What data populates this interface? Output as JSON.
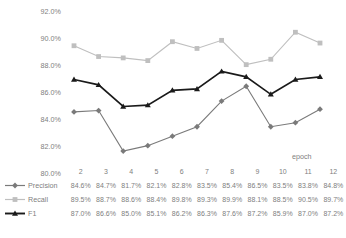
{
  "chart_data": {
    "type": "line",
    "title": "",
    "xlabel": "epoch",
    "ylabel": "",
    "x": [
      2,
      3,
      4,
      5,
      6,
      7,
      8,
      9,
      10,
      11,
      12
    ],
    "categories": [
      "2",
      "3",
      "4",
      "5",
      "6",
      "7",
      "8",
      "9",
      "10",
      "11",
      "12"
    ],
    "ylim": [
      80.0,
      92.0
    ],
    "ytick_step": 2.0,
    "yticks": [
      "92.0%",
      "90.0%",
      "88.0%",
      "86.0%",
      "84.0%",
      "82.0%",
      "80.0%"
    ],
    "ytick_values": [
      92.0,
      90.0,
      88.0,
      86.0,
      84.0,
      82.0,
      80.0
    ],
    "grid": false,
    "legend_position": "bottom-table",
    "series": [
      {
        "name": "Precision",
        "marker": "diamond",
        "color": "#7a7a7a",
        "values": [
          84.6,
          84.7,
          81.7,
          82.1,
          82.8,
          83.5,
          85.4,
          86.5,
          83.5,
          83.8,
          84.8
        ],
        "labels": [
          "84.6%",
          "84.7%",
          "81.7%",
          "82.1%",
          "82.8%",
          "83.5%",
          "85.4%",
          "86.5%",
          "83.5%",
          "83.8%",
          "84.8%"
        ]
      },
      {
        "name": "Recall",
        "marker": "square",
        "color": "#bfbfbf",
        "values": [
          89.5,
          88.7,
          88.6,
          88.4,
          89.8,
          89.3,
          89.9,
          88.1,
          88.5,
          90.5,
          89.7
        ],
        "labels": [
          "89.5%",
          "88.7%",
          "88.6%",
          "88.4%",
          "89.8%",
          "89.3%",
          "89.9%",
          "88.1%",
          "88.5%",
          "90.5%",
          "89.7%"
        ]
      },
      {
        "name": "F1",
        "marker": "triangle",
        "color": "#1a1a1a",
        "values": [
          87.0,
          86.6,
          85.0,
          85.1,
          86.2,
          86.3,
          87.6,
          87.2,
          85.9,
          87.0,
          87.2
        ],
        "labels": [
          "87.0%",
          "86.6%",
          "85.0%",
          "85.1%",
          "86.2%",
          "86.3%",
          "87.6%",
          "87.2%",
          "85.9%",
          "87.0%",
          "87.2%"
        ]
      }
    ]
  },
  "table": {
    "header_blank": "",
    "row_label_precision": "Precision",
    "row_label_recall": "Recall",
    "row_label_f1": "F1"
  },
  "axis": {
    "x_title": "epoch"
  }
}
